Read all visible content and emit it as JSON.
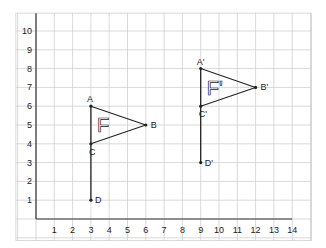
{
  "chart_data": {
    "type": "diagram",
    "title": "",
    "x_ticks": [
      "1",
      "2",
      "3",
      "4",
      "5",
      "6",
      "7",
      "8",
      "9",
      "10",
      "11",
      "12",
      "13",
      "14"
    ],
    "y_ticks": [
      "1",
      "2",
      "3",
      "4",
      "5",
      "6",
      "7",
      "8",
      "9",
      "10"
    ],
    "xlim": [
      0,
      14
    ],
    "ylim": [
      0,
      10
    ],
    "grid": true,
    "shapes": [
      {
        "name": "F",
        "label": "F",
        "points": {
          "A": [
            3,
            6
          ],
          "B": [
            6,
            5
          ],
          "C": [
            3,
            4
          ],
          "D": [
            3,
            1
          ]
        }
      },
      {
        "name": "F'",
        "label": "F'",
        "points": {
          "A'": [
            9,
            8
          ],
          "B'": [
            12,
            7
          ],
          "C'": [
            9,
            6
          ],
          "D'": [
            9,
            3
          ]
        }
      }
    ]
  },
  "labels": {
    "A": "A",
    "B": "B",
    "C": "C",
    "D": "D",
    "A1": "A'",
    "B1": "B'",
    "C1": "C'",
    "D1": "D'",
    "F": "F",
    "F1": "F'"
  },
  "colors": {
    "grid": "#cfcfcf",
    "axis": "#333333",
    "shape": "#222222",
    "background": "#ffffff"
  }
}
